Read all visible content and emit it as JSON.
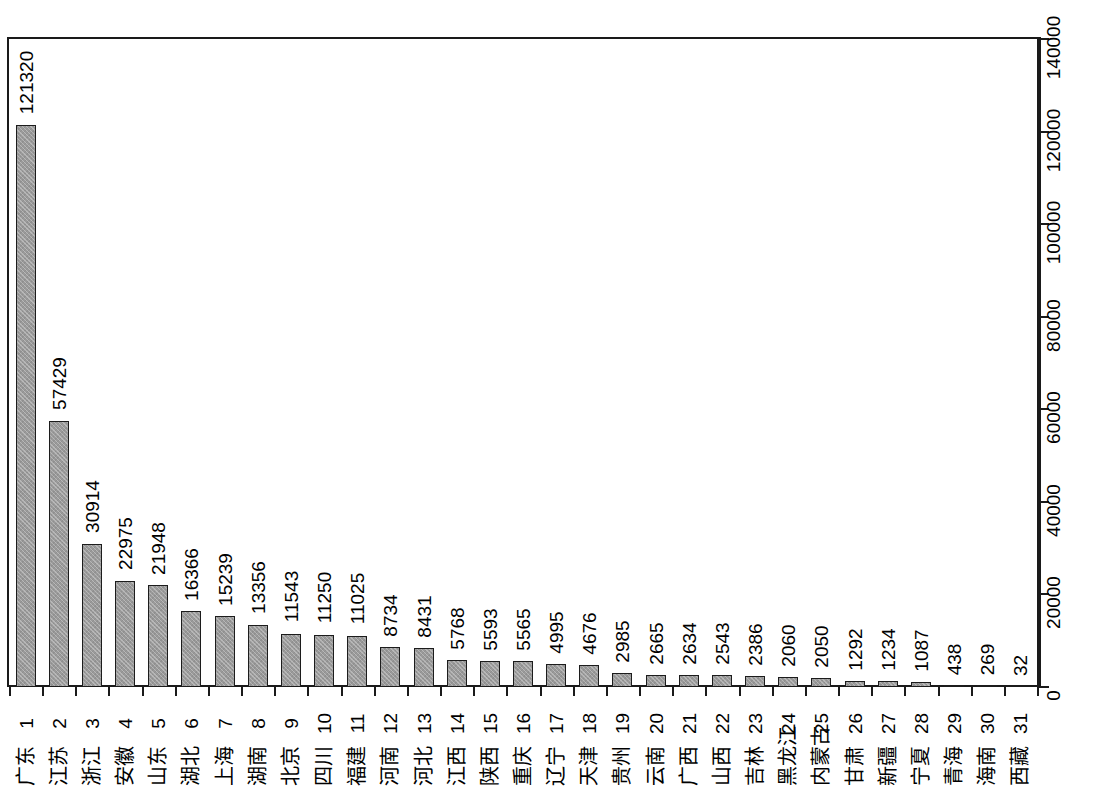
{
  "chart_data": {
    "type": "bar",
    "title": "",
    "subtitle": "",
    "xlabel": "",
    "ylabel": "",
    "ylim": [
      0,
      140000
    ],
    "grid": false,
    "legend": null,
    "y_ticks": [
      "0",
      "20000",
      "40000",
      "60000",
      "80000",
      "100000",
      "120000",
      "140000"
    ],
    "y_tick_values": [
      0,
      20000,
      40000,
      60000,
      80000,
      100000,
      120000,
      140000
    ],
    "indices": [
      "1",
      "2",
      "3",
      "4",
      "5",
      "6",
      "7",
      "8",
      "9",
      "10",
      "11",
      "12",
      "13",
      "14",
      "15",
      "16",
      "17",
      "18",
      "19",
      "20",
      "21",
      "22",
      "23",
      "24",
      "25",
      "26",
      "27",
      "28",
      "29",
      "30",
      "31"
    ],
    "categories": [
      "广东",
      "江苏",
      "浙江",
      "安徽",
      "山东",
      "湖北",
      "上海",
      "湖南",
      "北京",
      "四川",
      "福建",
      "河南",
      "河北",
      "江西",
      "陕西",
      "重庆",
      "辽宁",
      "天津",
      "贵州",
      "云南",
      "广西",
      "山西",
      "吉林",
      "黑龙江",
      "内蒙古",
      "甘肃",
      "新疆",
      "宁夏",
      "青海",
      "海南",
      "西藏"
    ],
    "values": [
      121320,
      57429,
      30914,
      22975,
      21948,
      16366,
      15239,
      13356,
      11543,
      11250,
      11025,
      8734,
      8431,
      5768,
      5593,
      5565,
      4995,
      4676,
      2985,
      2665,
      2634,
      2543,
      2386,
      2060,
      2050,
      1292,
      1234,
      1087,
      438,
      269,
      32
    ],
    "value_labels": [
      "121320",
      "57429",
      "30914",
      "22975",
      "21948",
      "16366",
      "15239",
      "13356",
      "11543",
      "11250",
      "11025",
      "8734",
      "8431",
      "5768",
      "5593",
      "5565",
      "4995",
      "4676",
      "2985",
      "2665",
      "2634",
      "2543",
      "2386",
      "2060",
      "2050",
      "1292",
      "1234",
      "1087",
      "438",
      "269",
      "32"
    ],
    "bar_color": "#9a9a9a",
    "bar_edge_color": "#1c1c1c",
    "axis_color": "#1a1a1a",
    "background_color": "#ffffff"
  }
}
